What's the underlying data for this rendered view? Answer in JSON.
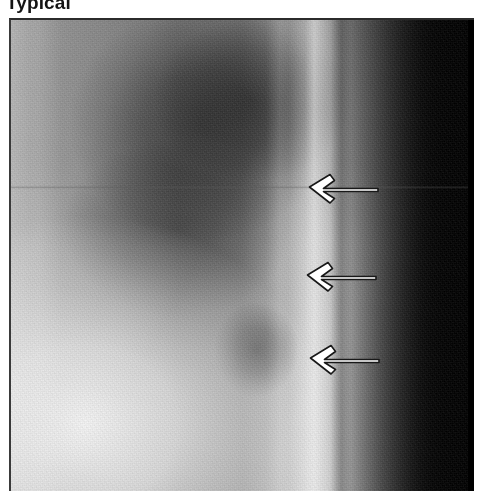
{
  "figure": {
    "label": "Typical",
    "modality": "chest radiograph"
  },
  "radiograph": {
    "frame": {
      "x": 9,
      "y": 18,
      "width": 465,
      "height": 473,
      "border_color": "#2b2b2b"
    },
    "tones": {
      "background_left": "#a9a9a9",
      "bright_stripe": "#dedede",
      "dark_right_field": "#030303",
      "lower_left_bright": "#f2f2f2",
      "dark_mass": "#4a4a4a"
    }
  },
  "annotations": {
    "arrow_color": "#ffffff",
    "arrow_outline_color": "#1d1d1d",
    "arrows": [
      {
        "name": "arrow-1",
        "direction": "left",
        "x": 305,
        "y": 168,
        "width": 72,
        "height": 30
      },
      {
        "name": "arrow-2",
        "direction": "left",
        "x": 303,
        "y": 256,
        "width": 72,
        "height": 30
      },
      {
        "name": "arrow-3",
        "direction": "left",
        "x": 306,
        "y": 339,
        "width": 72,
        "height": 30
      }
    ]
  }
}
